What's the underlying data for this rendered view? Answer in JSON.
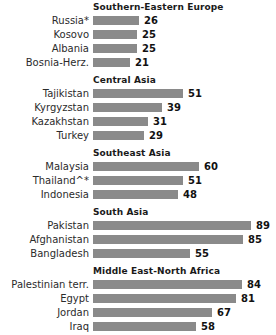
{
  "chart_data": {
    "type": "bar",
    "title": "",
    "xlabel": "",
    "ylabel": "",
    "xlim": [
      0,
      100
    ],
    "grid": false,
    "legend": null,
    "orientation": "horizontal",
    "bar_color": "#8a8a8a",
    "background": "#ffffff",
    "groups": [
      {
        "header": "Southern-Eastern  Europe",
        "categories": [
          "Russia*",
          "Kosovo",
          "Albania",
          "Bosnia-Herz."
        ],
        "values": [
          26,
          25,
          25,
          21
        ]
      },
      {
        "header": "Central Asia",
        "categories": [
          "Tajikistan",
          "Kyrgyzstan",
          "Kazakhstan",
          "Turkey"
        ],
        "values": [
          51,
          39,
          31,
          29
        ]
      },
      {
        "header": "Southeast  Asia",
        "categories": [
          "Malaysia",
          "Thailand^*",
          "Indonesia"
        ],
        "values": [
          60,
          51,
          48
        ]
      },
      {
        "header": "South  Asia",
        "categories": [
          "Pakistan",
          "Afghanistan",
          "Bangladesh"
        ],
        "values": [
          89,
          85,
          55
        ]
      },
      {
        "header": "Middle East-North  Africa",
        "categories": [
          "Palestinian terr.",
          "Egypt",
          "Jordan",
          "Iraq",
          "Lebanon",
          "Tunisia"
        ],
        "values": [
          84,
          81,
          67,
          58,
          46,
          44
        ]
      }
    ]
  }
}
